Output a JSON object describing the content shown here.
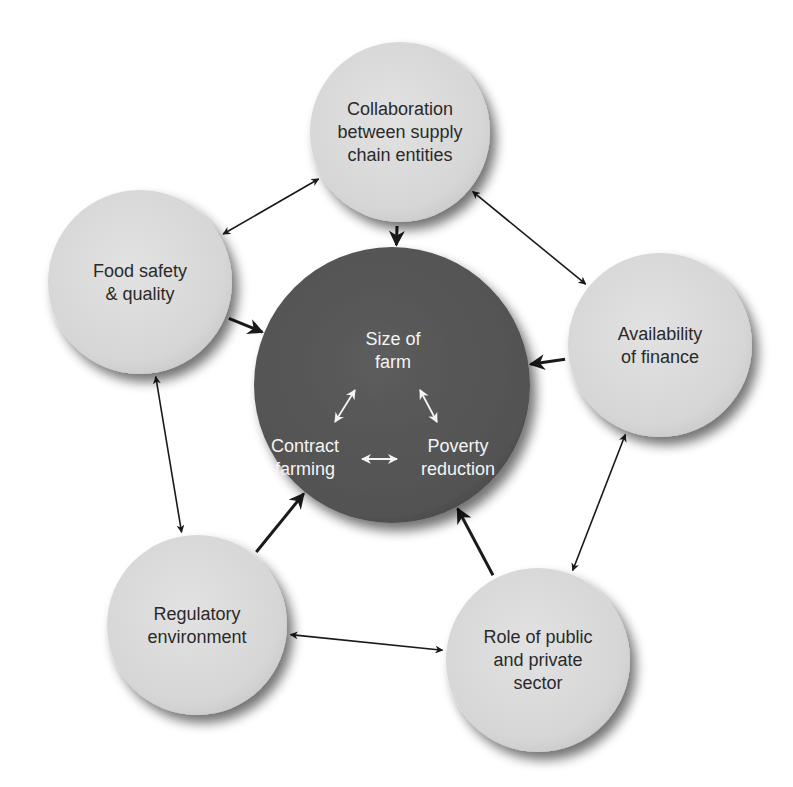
{
  "diagram": {
    "center": {
      "label": "Core relationship",
      "items": [
        {
          "id": "size",
          "lines": [
            "Size of",
            "farm"
          ]
        },
        {
          "id": "contract",
          "lines": [
            "Contract",
            "farming"
          ]
        },
        {
          "id": "poverty",
          "lines": [
            "Poverty",
            "reduction"
          ]
        }
      ],
      "links": [
        {
          "from": "size",
          "to": "contract",
          "type": "bidirectional"
        },
        {
          "from": "size",
          "to": "poverty",
          "type": "bidirectional"
        },
        {
          "from": "contract",
          "to": "poverty",
          "type": "bidirectional"
        }
      ]
    },
    "nodes": [
      {
        "id": "collaboration",
        "lines": [
          "Collaboration",
          "between supply",
          "chain entities"
        ]
      },
      {
        "id": "food",
        "lines": [
          "Food safety",
          "& quality"
        ]
      },
      {
        "id": "finance",
        "lines": [
          "Availability",
          "of finance"
        ]
      },
      {
        "id": "regulatory",
        "lines": [
          "Regulatory",
          "environment"
        ]
      },
      {
        "id": "role",
        "lines": [
          "Role of public",
          "and private",
          "sector"
        ]
      }
    ],
    "edges": [
      {
        "from": "collaboration",
        "to": "food",
        "type": "bidirectional"
      },
      {
        "from": "collaboration",
        "to": "finance",
        "type": "bidirectional"
      },
      {
        "from": "food",
        "to": "regulatory",
        "type": "bidirectional"
      },
      {
        "from": "finance",
        "to": "role",
        "type": "bidirectional"
      },
      {
        "from": "regulatory",
        "to": "role",
        "type": "bidirectional"
      },
      {
        "from": "collaboration",
        "to": "center",
        "type": "directed"
      },
      {
        "from": "food",
        "to": "center",
        "type": "directed"
      },
      {
        "from": "finance",
        "to": "center",
        "type": "directed"
      },
      {
        "from": "regulatory",
        "to": "center",
        "type": "directed"
      },
      {
        "from": "role",
        "to": "center",
        "type": "directed"
      }
    ],
    "colors": {
      "node_fill": "#d9d9d9",
      "center_fill": "#555555",
      "arrow": "#1a1a1a",
      "center_text": "#f4f4f4",
      "node_text": "#2a2a2a"
    }
  }
}
